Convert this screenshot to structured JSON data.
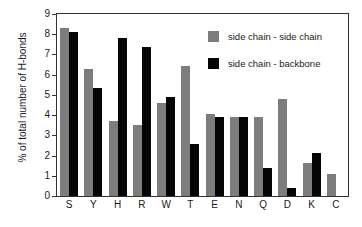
{
  "chart_data": {
    "type": "bar",
    "title": "",
    "subtitle": "",
    "xlabel": "",
    "ylabel": "% of total number of H-bonds",
    "ylim": [
      0,
      9
    ],
    "ytick_labels": [
      "0",
      "1",
      "2",
      "3",
      "4",
      "5",
      "6",
      "7",
      "8",
      "9"
    ],
    "ytick_values": [
      0,
      1,
      2,
      3,
      4,
      5,
      6,
      7,
      8,
      9
    ],
    "grid": false,
    "legend_position": "upper-right-inside",
    "categories": [
      "S",
      "Y",
      "H",
      "R",
      "W",
      "T",
      "E",
      "N",
      "Q",
      "D",
      "K",
      "C"
    ],
    "series": [
      {
        "name": "side chain - side chain",
        "color": "#7d7d7d",
        "values": [
          8.3,
          6.3,
          3.7,
          3.5,
          4.6,
          6.45,
          4.05,
          3.9,
          3.9,
          4.8,
          1.65,
          1.1
        ]
      },
      {
        "name": "side chain - backbone",
        "color": "#050505",
        "values": [
          8.1,
          5.35,
          7.8,
          7.35,
          4.9,
          2.55,
          3.9,
          3.9,
          1.4,
          0.4,
          2.15,
          0
        ]
      }
    ]
  },
  "legend": {
    "entries": [
      {
        "label": "side chain - side chain",
        "color": "#7d7d7d"
      },
      {
        "label": "side chain - backbone",
        "color": "#050505"
      }
    ]
  },
  "axes": {
    "y_title": "% of total number of H-bonds"
  }
}
